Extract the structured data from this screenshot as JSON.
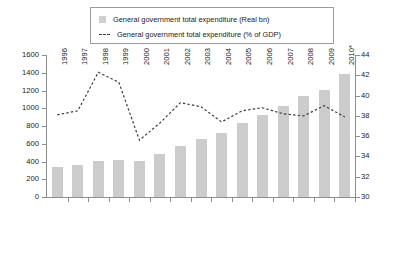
{
  "legend": {
    "items": [
      {
        "label": "General government total expenditure (Real bn)",
        "marker": "bar-swatch-icon",
        "color": "#cccccc"
      },
      {
        "label": "General government total expenditure (% of GDP)",
        "marker": "dashed-line-icon",
        "color": "#3a3a3a"
      }
    ]
  },
  "chart_data": {
    "type": "bar",
    "title": "",
    "subtitle": "",
    "xlabel": "",
    "ylabel": "",
    "y2label": "",
    "grid": false,
    "legend_position": "top-center",
    "categories": [
      "1996",
      "1997",
      "1998",
      "1999",
      "2000",
      "2001",
      "2002",
      "2003",
      "2004",
      "2005",
      "2006",
      "2007",
      "2008",
      "2009",
      "2010*"
    ],
    "series": [
      {
        "name": "General government total expenditure (Real bn)",
        "type": "bar",
        "axis": "left",
        "color": "#cccccc",
        "values": [
          340,
          365,
          405,
          415,
          405,
          480,
          580,
          650,
          720,
          830,
          925,
          1020,
          1135,
          1205,
          1385
        ]
      },
      {
        "name": "General government total expenditure (% of GDP)",
        "type": "line",
        "axis": "right",
        "color": "#3a3a3a",
        "style": "dashed",
        "values": [
          38.1,
          38.5,
          42.3,
          41.3,
          35.6,
          37.3,
          39.3,
          38.9,
          37.4,
          38.5,
          38.8,
          38.2,
          38.0,
          39.0,
          37.9
        ]
      }
    ],
    "ylim": [
      0,
      1600
    ],
    "yticks": [
      0,
      200,
      400,
      600,
      800,
      1000,
      1200,
      1400,
      1600
    ],
    "y2lim": [
      30,
      44
    ],
    "y2ticks": [
      30,
      32,
      34,
      36,
      38,
      40,
      42,
      44
    ]
  }
}
